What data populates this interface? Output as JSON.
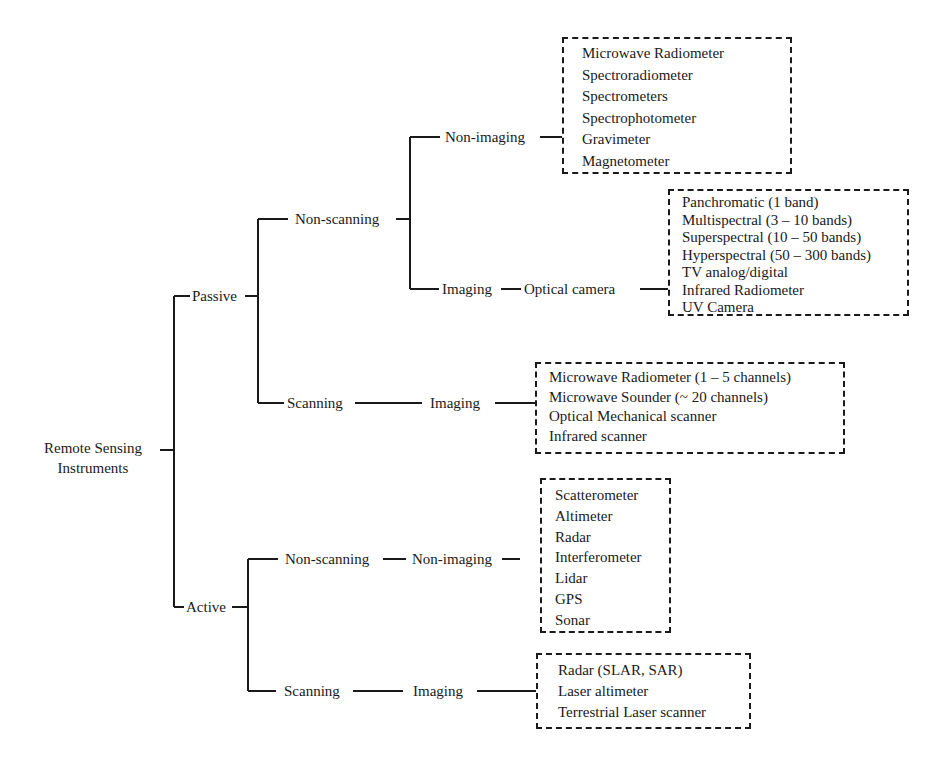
{
  "diagram": {
    "root": {
      "line1": "Remote Sensing",
      "line2": "Instruments"
    },
    "passive": {
      "label": "Passive",
      "non_scanning": {
        "label": "Non-scanning",
        "non_imaging": {
          "label": "Non-imaging",
          "items": [
            "Microwave Radiometer",
            "Spectroradiometer",
            "Spectrometers",
            "Spectrophotometer",
            "Gravimeter",
            "Magnetometer"
          ]
        },
        "imaging": {
          "label": "Imaging",
          "sub_label": "Optical camera",
          "items": [
            "Panchromatic (1 band)",
            "Multispectral (3 – 10 bands)",
            "Superspectral (10 – 50 bands)",
            "Hyperspectral (50 – 300 bands)",
            "TV analog/digital",
            "Infrared Radiometer",
            "UV Camera"
          ]
        }
      },
      "scanning": {
        "label": "Scanning",
        "imaging": {
          "label": "Imaging",
          "items": [
            "Microwave Radiometer (1 – 5 channels)",
            "Microwave Sounder (~ 20 channels)",
            "Optical Mechanical scanner",
            "Infrared scanner"
          ]
        }
      }
    },
    "active": {
      "label": "Active",
      "non_scanning": {
        "label": "Non-scanning",
        "non_imaging": {
          "label": "Non-imaging",
          "items": [
            "Scatterometer",
            "Altimeter",
            "Radar",
            "Interferometer",
            "Lidar",
            "GPS",
            "Sonar"
          ]
        }
      },
      "scanning": {
        "label": "Scanning",
        "imaging": {
          "label": "Imaging",
          "items": [
            "Radar (SLAR, SAR)",
            "Laser altimeter",
            "Terrestrial Laser scanner"
          ]
        }
      }
    },
    "colors": {
      "line": "#1a1a1a",
      "background": "#ffffff"
    }
  }
}
